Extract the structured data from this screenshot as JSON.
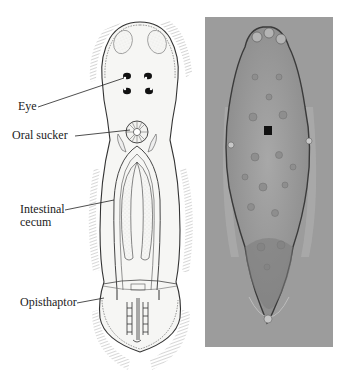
{
  "figure": {
    "panels": [
      {
        "type": "illustration",
        "subject": "monogenean flatworm (line drawing)"
      },
      {
        "type": "micrograph",
        "subject": "monogenean flatworm (light micrograph)"
      }
    ],
    "labels": {
      "eye": "Eye",
      "oral_sucker": "Oral sucker",
      "intestinal_cecum_line1": "Intestinal",
      "intestinal_cecum_line2": "cecum",
      "opisthaptor": "Opisthaptor"
    },
    "colors": {
      "background": "#ffffff",
      "ink": "#222222",
      "photo_background": "#9a9a9a",
      "body_fill": "#f4f4f2"
    }
  }
}
